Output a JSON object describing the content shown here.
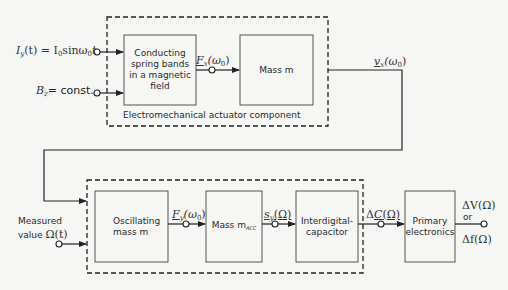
{
  "diagram": {
    "type": "block-diagram",
    "top_group": {
      "label": "Electromechanical actuator component",
      "inputs": [
        {
          "id": "current",
          "label": "I_y(t) = I_0 sin ω_0 t"
        },
        {
          "id": "field",
          "label": "B_z = const."
        }
      ],
      "blocks": [
        {
          "id": "spring-bands",
          "lines": [
            "Conducting",
            "spring bands",
            "in a magnetic",
            "field"
          ]
        },
        {
          "id": "mass-m-top",
          "lines": [
            "Mass m"
          ]
        }
      ],
      "signals": [
        {
          "from": "spring-bands",
          "to": "mass-m-top",
          "label": "F_x(ω_0)"
        }
      ],
      "output": {
        "label": "v_x(ω_0)"
      }
    },
    "bottom_group": {
      "inputs": [
        {
          "id": "feedback",
          "from": "v_x(ω_0)"
        },
        {
          "id": "measured",
          "lines": [
            "Measured",
            "value Ω(t)"
          ]
        }
      ],
      "blocks": [
        {
          "id": "osc-mass",
          "lines": [
            "Oscillating",
            "mass m"
          ]
        },
        {
          "id": "mass-acc",
          "lines": [
            "Mass m_ACC"
          ]
        },
        {
          "id": "interdigital",
          "lines": [
            "Interdigital-",
            "capacitor"
          ]
        }
      ],
      "signals": [
        {
          "from": "osc-mass",
          "to": "mass-acc",
          "label": "F_y(ω_0)"
        },
        {
          "from": "mass-acc",
          "to": "interdigital",
          "label": "s_y(Ω)"
        },
        {
          "from": "interdigital",
          "to": "primary-electronics",
          "label": "ΔC(Ω)"
        }
      ]
    },
    "external_block": {
      "id": "primary-electronics",
      "lines": [
        "Primary",
        "electronics"
      ]
    },
    "final_output": {
      "top": "ΔV(Ω)",
      "middle": "or",
      "bottom": "Δf(Ω)"
    }
  },
  "labels": {
    "actuator_caption": "Electromechanical actuator component",
    "iy_lhs": "I",
    "iy_sub": "y",
    "iy_rest": "(t) = I",
    "iy_sub0": "0",
    "iy_sin": "sinω",
    "iy_sub0b": "0",
    "iy_t": "t",
    "bz": "B",
    "bz_sub": "z",
    "bz_rest": "= const.",
    "box1_l1": "Conducting",
    "box1_l2": "spring bands",
    "box1_l3": "in a magnetic",
    "box1_l4": "field",
    "box2": "Mass m",
    "fx_F": "F",
    "fx_sub": "x",
    "fx_rest": "(ω",
    "fx_sub0": "0",
    "fx_close": ")",
    "vx_v": "v",
    "vx_sub": "x",
    "vx_rest": "(ω",
    "vx_sub0": "0",
    "vx_close": ")",
    "measured_l1": "Measured",
    "measured_l2": "value",
    "omega_t": "Ω(t)",
    "osc_l1": "Oscillating",
    "osc_l2": "mass m",
    "fy_F": "F",
    "fy_sub": "y",
    "fy_rest": "(ω",
    "fy_sub0": "0",
    "fy_close": ")",
    "macc": "Mass m",
    "macc_sub": "ACC",
    "sy_s": "s",
    "sy_sub": "y",
    "sy_rest": "(Ω)",
    "cap_l1": "Interdigital-",
    "cap_l2": "capacitor",
    "dc_delta": "Δ",
    "dc_C": "C",
    "dc_rest": "(Ω)",
    "pe_l1": "Primary",
    "pe_l2": "electronics",
    "dv": "ΔV(Ω)",
    "or": "or",
    "df": "Δf(Ω)"
  }
}
